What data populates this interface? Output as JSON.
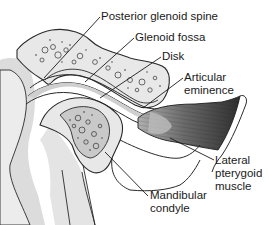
{
  "diagram": {
    "labels": {
      "posterior_glenoid_spine": "Posterior glenoid spine",
      "glenoid_fossa": "Glenoid fossa",
      "disk": "Disk",
      "articular_eminence_line1": "Articular",
      "articular_eminence_line2": "eminence",
      "lateral_pterygoid_line1": "Lateral",
      "lateral_pterygoid_line2": "pterygoid",
      "lateral_pterygoid_line3": "muscle",
      "mandibular_condyle_line1": "Mandibular",
      "mandibular_condyle_line2": "condyle"
    },
    "colors": {
      "outline": "#2a2a2a",
      "bone_fill": "#e6e6e6",
      "bone_dark": "#bdbdbd",
      "muscle_dark": "#3a3a3a",
      "muscle_light": "#9a9a9a",
      "background_shadow": "#d4d4d4"
    }
  }
}
